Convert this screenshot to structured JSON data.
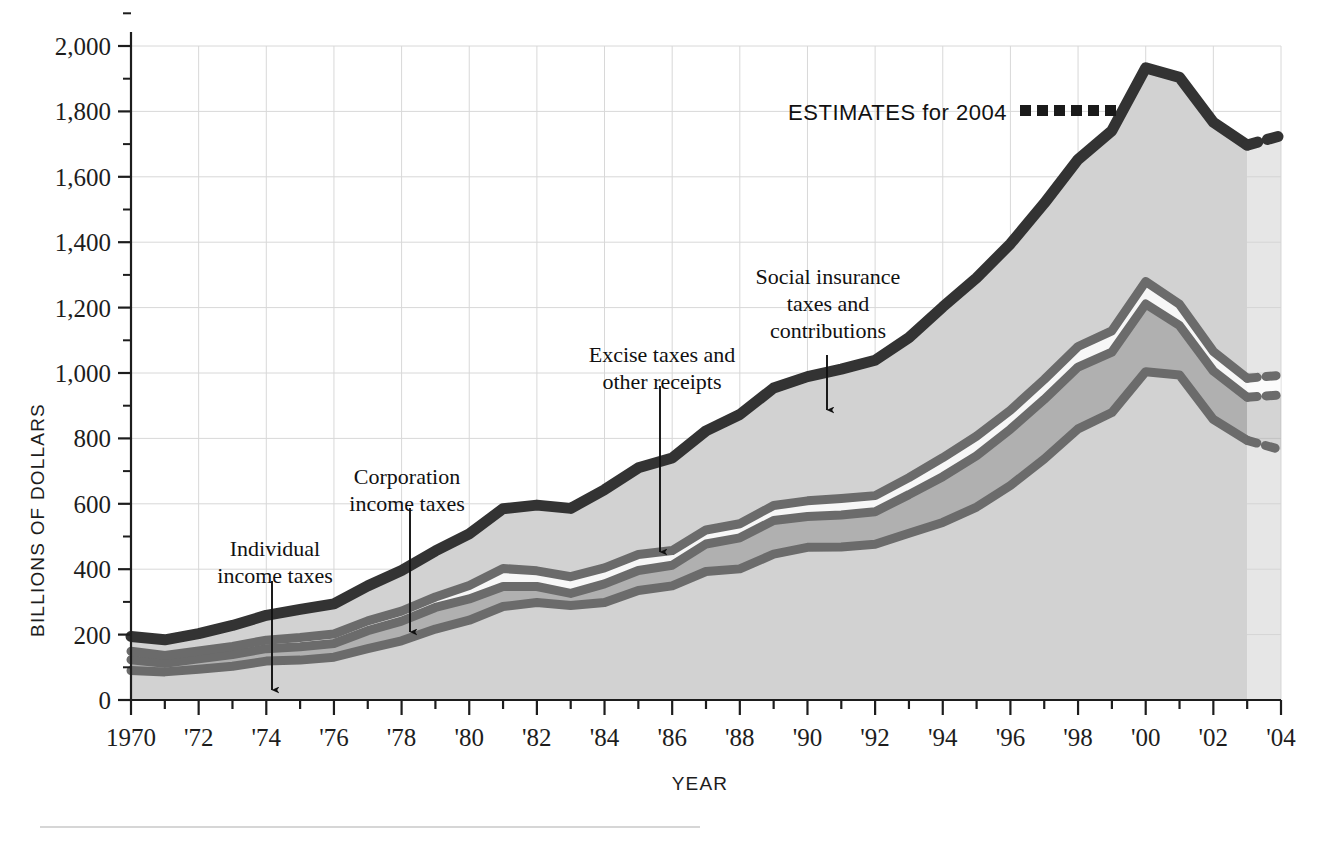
{
  "axes": {
    "y_title": "BILLIONS OF DOLLARS",
    "x_title": "YEAR",
    "y_ticks": [
      "0",
      "200",
      "400",
      "600",
      "800",
      "1,000",
      "1,200",
      "1,400",
      "1,600",
      "1,800",
      "2,000"
    ],
    "x_ticks": [
      "1970",
      "'72",
      "'74",
      "'76",
      "'78",
      "'80",
      "'82",
      "'84",
      "'86",
      "'88",
      "'90",
      "'92",
      "'94",
      "'96",
      "'98",
      "'00",
      "'02",
      "'04"
    ]
  },
  "legend": {
    "estimates_label": "ESTIMATES for 2004",
    "estimates_swatch": "dashed-line-swatch"
  },
  "annotations": [
    {
      "id": "individual",
      "lines": [
        "Individual",
        "income taxes"
      ],
      "arrow": "down-arrow-icon"
    },
    {
      "id": "corporation",
      "lines": [
        "Corporation",
        "income taxes"
      ],
      "arrow": "down-arrow-icon"
    },
    {
      "id": "excise",
      "lines": [
        "Excise taxes and",
        "other receipts"
      ],
      "arrow": "down-arrow-icon"
    },
    {
      "id": "social",
      "lines": [
        "Social insurance",
        "taxes and",
        "contributions"
      ],
      "arrow": "down-arrow-icon"
    }
  ],
  "colors": {
    "individual_fill": "#d2d2d2",
    "corporation_fill": "#b0b0b0",
    "excise_fill": "#f7f7f7",
    "social_fill": "#d2d2d2",
    "band_outline": "#6b6b6b",
    "top_outline": "#333333",
    "gridline": "#d8d8d8",
    "axis": "#1d1d1d"
  },
  "chart_data": {
    "type": "area",
    "title": "",
    "xlabel": "YEAR",
    "ylabel": "BILLIONS OF DOLLARS",
    "xlim": [
      1970,
      2004
    ],
    "ylim": [
      0,
      2000
    ],
    "grid": true,
    "stacked": true,
    "legend_position": "inline-annotations",
    "estimate_from_year": 2003,
    "x": [
      1970,
      1971,
      1972,
      1973,
      1974,
      1975,
      1976,
      1977,
      1978,
      1979,
      1980,
      1981,
      1982,
      1983,
      1984,
      1985,
      1986,
      1987,
      1988,
      1989,
      1990,
      1991,
      1992,
      1993,
      1994,
      1995,
      1996,
      1997,
      1998,
      1999,
      2000,
      2001,
      2002,
      2003,
      2004
    ],
    "series": [
      {
        "name": "Individual income taxes",
        "values": [
          90,
          86,
          94,
          103,
          119,
          122,
          131,
          157,
          181,
          217,
          244,
          286,
          298,
          289,
          298,
          335,
          349,
          393,
          401,
          446,
          467,
          468,
          476,
          510,
          543,
          590,
          656,
          737,
          829,
          879,
          1004,
          994,
          858,
          794,
          765
        ]
      },
      {
        "name": "Corporation income taxes",
        "values": [
          33,
          26,
          32,
          36,
          38,
          41,
          42,
          55,
          60,
          66,
          65,
          61,
          49,
          37,
          57,
          61,
          63,
          84,
          95,
          103,
          94,
          98,
          100,
          118,
          140,
          157,
          172,
          182,
          189,
          185,
          207,
          151,
          148,
          132,
          168
        ]
      },
      {
        "name": "Excise taxes and other receipts",
        "values": [
          26,
          24,
          24,
          25,
          26,
          28,
          29,
          30,
          31,
          32,
          41,
          55,
          48,
          51,
          49,
          49,
          45,
          43,
          43,
          46,
          48,
          50,
          49,
          52,
          58,
          60,
          58,
          61,
          63,
          65,
          69,
          65,
          60,
          58,
          60
        ]
      },
      {
        "name": "Social insurance taxes and contributions",
        "values": [
          45,
          48,
          53,
          64,
          76,
          86,
          92,
          107,
          124,
          141,
          158,
          183,
          201,
          209,
          239,
          265,
          283,
          303,
          334,
          359,
          380,
          396,
          414,
          428,
          461,
          484,
          509,
          539,
          572,
          612,
          653,
          694,
          701,
          713,
          733
        ]
      }
    ],
    "totals": [
      194,
      184,
      203,
      228,
      259,
      277,
      294,
      349,
      396,
      456,
      508,
      585,
      596,
      586,
      643,
      710,
      740,
      823,
      873,
      954,
      989,
      1012,
      1039,
      1108,
      1202,
      1291,
      1395,
      1519,
      1653,
      1741,
      1933,
      1904,
      1767,
      1697,
      1726
    ]
  }
}
